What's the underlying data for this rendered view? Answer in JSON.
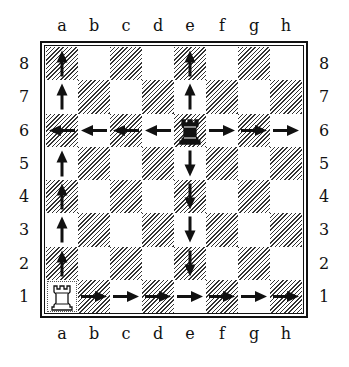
{
  "diagram": {
    "files": [
      "a",
      "b",
      "c",
      "d",
      "e",
      "f",
      "g",
      "h"
    ],
    "ranks": [
      "8",
      "7",
      "6",
      "5",
      "4",
      "3",
      "2",
      "1"
    ],
    "pieces": [
      {
        "name": "black-rook",
        "square": "e6",
        "color": "black",
        "symbol": "♜"
      },
      {
        "name": "white-rook",
        "square": "a1",
        "color": "white",
        "symbol": "♖"
      }
    ],
    "arrows": [
      {
        "square": "a8",
        "dir": "up"
      },
      {
        "square": "a7",
        "dir": "up"
      },
      {
        "square": "a6",
        "dir": "left"
      },
      {
        "square": "a5",
        "dir": "up"
      },
      {
        "square": "a4",
        "dir": "up"
      },
      {
        "square": "a3",
        "dir": "up"
      },
      {
        "square": "a2",
        "dir": "up"
      },
      {
        "square": "b6",
        "dir": "left"
      },
      {
        "square": "c6",
        "dir": "left"
      },
      {
        "square": "d6",
        "dir": "left"
      },
      {
        "square": "f6",
        "dir": "right"
      },
      {
        "square": "g6",
        "dir": "right"
      },
      {
        "square": "h6",
        "dir": "right"
      },
      {
        "square": "e8",
        "dir": "up"
      },
      {
        "square": "e7",
        "dir": "up"
      },
      {
        "square": "e5",
        "dir": "down"
      },
      {
        "square": "e4",
        "dir": "down"
      },
      {
        "square": "e3",
        "dir": "down"
      },
      {
        "square": "e2",
        "dir": "down"
      },
      {
        "square": "b1",
        "dir": "right"
      },
      {
        "square": "c1",
        "dir": "right"
      },
      {
        "square": "d1",
        "dir": "right"
      },
      {
        "square": "e1",
        "dir": "right"
      },
      {
        "square": "f1",
        "dir": "right"
      },
      {
        "square": "g1",
        "dir": "right"
      },
      {
        "square": "h1",
        "dir": "right"
      }
    ]
  }
}
